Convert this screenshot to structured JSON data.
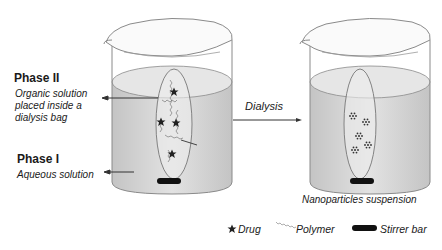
{
  "phase2": {
    "title": "Phase II",
    "desc_line1": "Organic solution",
    "desc_line2": "placed inside a",
    "desc_line3": "dialysis bag"
  },
  "phase1": {
    "title": "Phase I",
    "desc": "Aqueous solution"
  },
  "process": {
    "label": "Dialysis"
  },
  "result": {
    "caption": "Nanoparticles suspension"
  },
  "legend": {
    "drug": "Drug",
    "polymer": "Polymer",
    "stirrer": "Stirrer bar"
  },
  "colors": {
    "liquid": "#d6d6d6",
    "outline": "#7a7a7a",
    "ink": "#1a1a1a"
  }
}
